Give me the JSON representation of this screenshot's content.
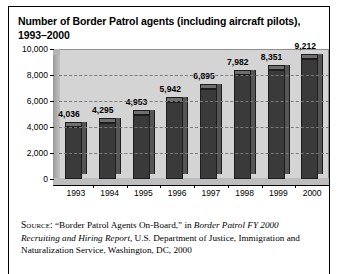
{
  "figure": {
    "title": "Number of Border Patrol agents (including aircraft pilots), 1993–2000",
    "source_label": "Source:",
    "source_part1": " “Border Patrol Agents On-Board,” in ",
    "source_italic1": "Border Patrol FY 2000 Recruiting and Hiring Report,",
    "source_part2": " U.S. Department of Justice, Immigration and Naturalization Service, Washington, DC, 2000"
  },
  "chart_data": {
    "type": "bar",
    "title": "Number of Border Patrol agents (including aircraft pilots), 1993–2000",
    "xlabel": "",
    "ylabel": "",
    "categories": [
      "1993",
      "1994",
      "1995",
      "1996",
      "1997",
      "1998",
      "1999",
      "2000"
    ],
    "values": [
      4036,
      4295,
      4953,
      5942,
      6895,
      7982,
      8351,
      9212
    ],
    "value_labels": [
      "4,036",
      "4,295",
      "4,953",
      "5,942",
      "6,895",
      "7,982",
      "8,351",
      "9,212"
    ],
    "ylim": [
      0,
      10000
    ],
    "ytick_values": [
      0,
      2000,
      4000,
      6000,
      8000,
      10000
    ],
    "ytick_labels": [
      "0",
      "2,000",
      "4,000",
      "6,000",
      "8,000",
      "10,000"
    ],
    "grid": true,
    "grid_style": "dashed",
    "legend": false,
    "style_3d": true,
    "bar_color": "#3a3a3a",
    "panel_color": "#d4d4d4"
  }
}
